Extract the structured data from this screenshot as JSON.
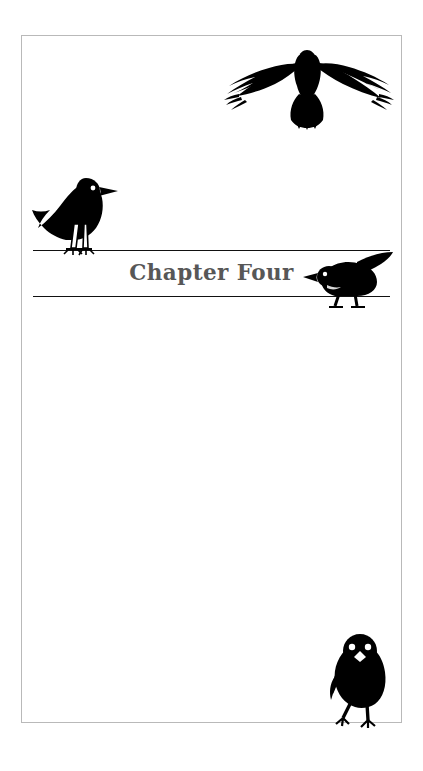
{
  "page": {
    "title": "Chapter Four",
    "background_color": "#ffffff",
    "frame_color": "#b9b9b9",
    "rule_color": "#111111",
    "title_color": "#575757",
    "silhouette_color": "#000000"
  },
  "heading": {
    "text": "Chapter Four",
    "rule_above": "horizontal-rule",
    "rule_below": "horizontal-rule"
  },
  "illustrations": [
    {
      "name": "crow-flying",
      "label": "Flying crow with outstretched wings",
      "position": "top-right"
    },
    {
      "name": "crow-perched",
      "label": "Crow perched on wire facing right",
      "position": "upper-left"
    },
    {
      "name": "crow-crouching",
      "label": "Crow crouching on wire facing left",
      "position": "center-right"
    },
    {
      "name": "crow-front",
      "label": "Young crow standing facing forward",
      "position": "bottom-right"
    }
  ]
}
